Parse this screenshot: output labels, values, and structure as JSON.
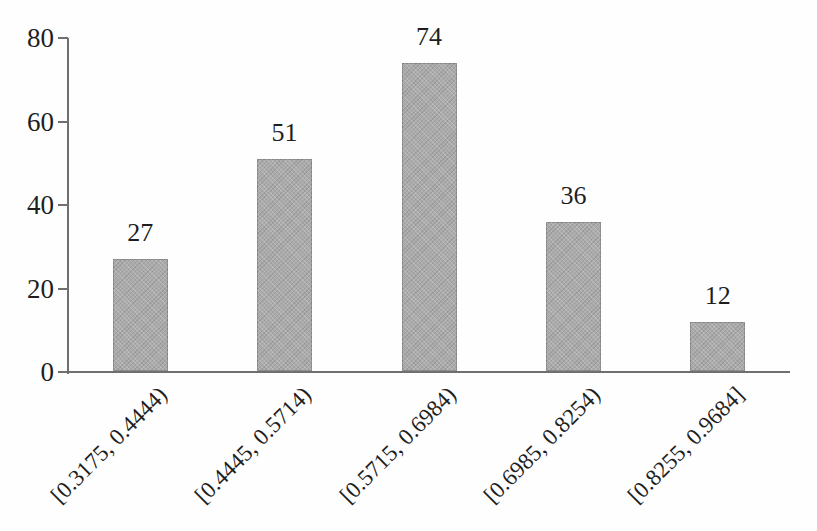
{
  "chart_data": {
    "type": "bar",
    "title": "",
    "subtitle": "",
    "xlabel": "",
    "ylabel": "",
    "categories": [
      "[0.3175, 0.4444)",
      "[0.4445, 0.5714)",
      "[0.5715, 0.6984)",
      "[0.6985, 0.8254)",
      "[0.8255, 0.9684]"
    ],
    "values": [
      27,
      51,
      74,
      36,
      12
    ],
    "ylim": [
      0,
      80
    ],
    "yticks": [
      0,
      20,
      40,
      60,
      80
    ],
    "data_labels": true,
    "grid": "off",
    "legend": "none",
    "x_tick_rotation_deg": 45,
    "bar_fill_color": "#ababab",
    "axis_color": "#6f6f6f",
    "text_color": "#1e1e1e",
    "background_color": "#fefefe"
  }
}
